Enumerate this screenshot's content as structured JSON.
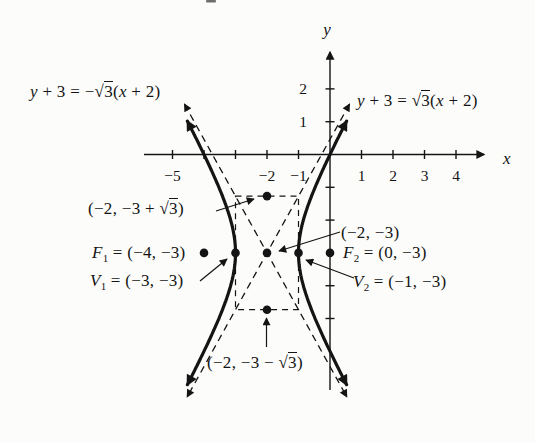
{
  "figure": {
    "background": "#fcfcfa",
    "ink": "#141414"
  },
  "chart_data": {
    "type": "line",
    "title": "",
    "curve": "hyperbola",
    "center": [
      -2,
      -3
    ],
    "a": 1,
    "b_squared": 3,
    "vertices": {
      "V1": [
        -3,
        -3
      ],
      "V2": [
        -1,
        -3
      ]
    },
    "foci": {
      "F1": [
        -4,
        -3
      ],
      "F2": [
        0,
        -3
      ]
    },
    "conjugate_axis_points": [
      [
        -2,
        -1.2679
      ],
      [
        -2,
        -4.7321
      ]
    ],
    "asymptote_slopes": [
      1.7320508,
      -1.7320508
    ],
    "asymptote_equations": [
      "y + 3 = −√3(x + 2)",
      "y + 3 = √3(x + 2)"
    ],
    "points": [
      [
        -4,
        -3
      ],
      [
        -3,
        -3
      ],
      [
        -2,
        -3
      ],
      [
        -1,
        -3
      ],
      [
        0,
        -3
      ],
      [
        -2,
        -1.2679
      ],
      [
        -2,
        -4.7321
      ]
    ],
    "x_ticks": [
      -5,
      -4,
      -3,
      -2,
      -1,
      1,
      2,
      3,
      4
    ],
    "y_ticks": [
      2,
      1,
      -1,
      -2,
      -4,
      -5
    ],
    "x_tick_labels": [
      {
        "v": -5,
        "t": "−5"
      },
      {
        "v": -2,
        "t": "−2"
      },
      {
        "v": -1,
        "t": "−1"
      },
      {
        "v": 1,
        "t": "1"
      },
      {
        "v": 2,
        "t": "2"
      },
      {
        "v": 3,
        "t": "3"
      },
      {
        "v": 4,
        "t": "4"
      }
    ],
    "y_tick_labels": [
      {
        "v": 2,
        "t": "2"
      },
      {
        "v": 1,
        "t": "1"
      }
    ],
    "xlabel": "x",
    "ylabel": "y",
    "grid": false,
    "axis_range": {
      "x": [
        -5.9,
        5.0
      ],
      "y": [
        -7.4,
        3.3
      ]
    }
  },
  "labels": {
    "eq_left": {
      "v1": "y",
      "mid": " + 3 = −√",
      "rad": "3",
      "open": "(",
      "v2": "x",
      "end": " + 2)"
    },
    "eq_right": {
      "v1": "y",
      "mid": " + 3 = √",
      "rad": "3",
      "open": "(",
      "v2": "x",
      "end": " + 2)"
    },
    "pt_top": {
      "pre": "(−2, −3 + √",
      "rad": "3",
      "post": ")"
    },
    "pt_bottom": {
      "pre": "(−2, −3 − √",
      "rad": "3",
      "post": ")"
    },
    "f1": {
      "name": "F",
      "sub": "1",
      "rest": " = (−4, −3)"
    },
    "v1": {
      "name": "V",
      "sub": "1",
      "rest": " = (−3, −3)"
    },
    "center_pt": {
      "text": "(−2, −3)"
    },
    "f2": {
      "name": "F",
      "sub": "2",
      "rest": " = (0, −3)"
    },
    "v2": {
      "name": "V",
      "sub": "2",
      "rest": " = (−1, −3)"
    }
  }
}
